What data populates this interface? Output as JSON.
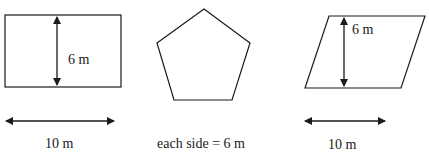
{
  "diagram": {
    "stroke_color": "#1a1a1a",
    "background": "#ffffff",
    "shapes": [
      {
        "id": "rectangle",
        "type": "rectangle",
        "height_label": "6 m",
        "base_label": "10 m"
      },
      {
        "id": "pentagon",
        "type": "regular-pentagon",
        "side_label": "each side = 6 m"
      },
      {
        "id": "parallelogram",
        "type": "parallelogram",
        "height_label": "6 m",
        "base_label": "10 m"
      }
    ],
    "caption_cutoff": ""
  }
}
